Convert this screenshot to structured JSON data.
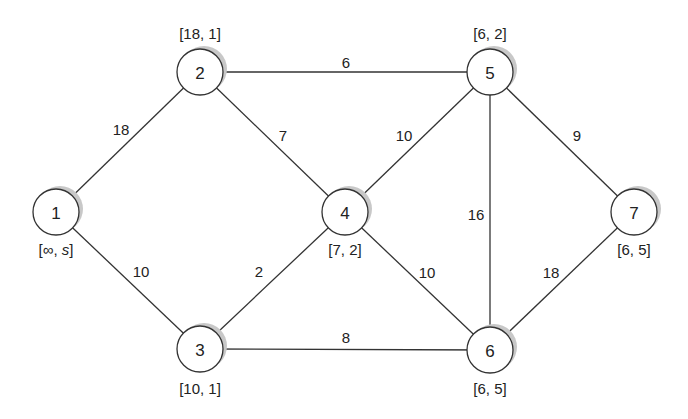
{
  "diagram": {
    "type": "weighted-undirected-graph",
    "nodes": [
      {
        "id": "1",
        "x": 56,
        "y": 212,
        "label": "[∞, s]",
        "label_x": 56,
        "label_y": 249
      },
      {
        "id": "2",
        "x": 200,
        "y": 72,
        "label": "[18, 1]",
        "label_x": 200,
        "label_y": 33
      },
      {
        "id": "3",
        "x": 200,
        "y": 349,
        "label": "[10, 1]",
        "label_x": 200,
        "label_y": 388
      },
      {
        "id": "4",
        "x": 345,
        "y": 212,
        "label": "[7, 2]",
        "label_x": 345,
        "label_y": 249
      },
      {
        "id": "5",
        "x": 490,
        "y": 72,
        "label": "[6, 2]",
        "label_x": 490,
        "label_y": 33
      },
      {
        "id": "6",
        "x": 490,
        "y": 350,
        "label": "[6, 5]",
        "label_x": 490,
        "label_y": 388
      },
      {
        "id": "7",
        "x": 634,
        "y": 212,
        "label": "[6, 5]",
        "label_x": 634,
        "label_y": 249
      }
    ],
    "edges": [
      {
        "from": "1",
        "to": "2",
        "weight": "18",
        "wx": 121,
        "wy": 129
      },
      {
        "from": "1",
        "to": "3",
        "weight": "10",
        "wx": 141,
        "wy": 271
      },
      {
        "from": "2",
        "to": "5",
        "weight": "6",
        "wx": 346,
        "wy": 62
      },
      {
        "from": "2",
        "to": "4",
        "weight": "7",
        "wx": 283,
        "wy": 135
      },
      {
        "from": "3",
        "to": "4",
        "weight": "2",
        "wx": 259,
        "wy": 271
      },
      {
        "from": "3",
        "to": "6",
        "weight": "8",
        "wx": 346,
        "wy": 337
      },
      {
        "from": "4",
        "to": "5",
        "weight": "10",
        "wx": 404,
        "wy": 135
      },
      {
        "from": "4",
        "to": "6",
        "weight": "10",
        "wx": 427,
        "wy": 272
      },
      {
        "from": "5",
        "to": "6",
        "weight": "16",
        "wx": 476,
        "wy": 214
      },
      {
        "from": "5",
        "to": "7",
        "weight": "9",
        "wx": 577,
        "wy": 135
      },
      {
        "from": "6",
        "to": "7",
        "weight": "18",
        "wx": 551,
        "wy": 272
      }
    ]
  }
}
